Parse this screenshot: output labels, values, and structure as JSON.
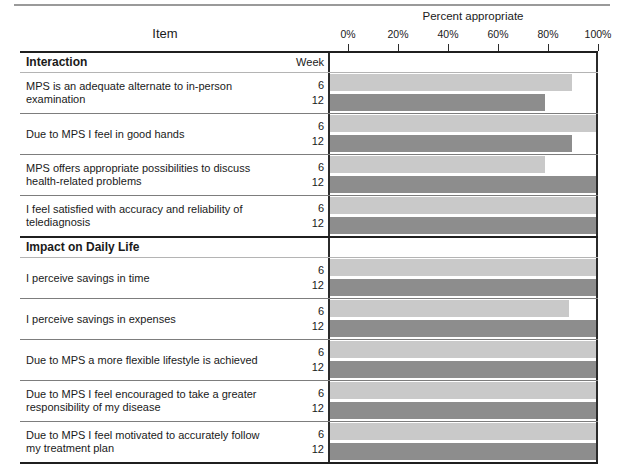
{
  "figure": {
    "chart_title": "Percent appropriate",
    "item_column_header": "Item",
    "week_column_header": "Week"
  },
  "axis": {
    "tick_labels": [
      "0%",
      "20%",
      "40%",
      "60%",
      "80%",
      "100%"
    ],
    "tick_values": [
      0,
      20,
      40,
      60,
      80,
      100
    ],
    "min": 0,
    "max": 100
  },
  "legend": {
    "week6_label": "6",
    "week12_label": "12",
    "week6_color": "#c9c9c9",
    "week12_color": "#8d8d8d"
  },
  "chart_data": {
    "type": "bar",
    "title": "Percent appropriate",
    "xlabel": "Percent appropriate",
    "ylabel": "Item",
    "xlim": [
      0,
      100
    ],
    "grid": false,
    "legend_position": "row-labels",
    "categories": [
      "MPS is an adequate alternate to in-person examination",
      "Due to MPS I feel in good hands",
      "MPS offers appropriate possibilities to discuss health-related problems",
      "I feel satisfied with accuracy and reliability of telediagnosis",
      "I perceive savings in time",
      "I perceive savings in expenses",
      "Due to MPS a more flexible lifestyle is achieved",
      "Due to MPS I feel encouraged to take a greater responsibility of my disease",
      "Due to MPS I feel motivated to accurately follow my treatment plan"
    ],
    "series": [
      {
        "name": "Week 6",
        "values": [
          91,
          100,
          81,
          100,
          100,
          90,
          100,
          100,
          100
        ]
      },
      {
        "name": "Week 12",
        "values": [
          81,
          91,
          100,
          100,
          100,
          100,
          100,
          100,
          100
        ]
      }
    ]
  },
  "sections": [
    {
      "heading": "Interaction",
      "week_header": "Week",
      "rows": [
        {
          "item": "MPS is an adequate alternate to in-person examination",
          "week6_label": "6",
          "week12_label": "12",
          "week6": 91,
          "week12": 81
        },
        {
          "item": "Due to MPS I feel in good hands",
          "week6_label": "6",
          "week12_label": "12",
          "week6": 100,
          "week12": 91
        },
        {
          "item": "MPS offers appropriate possibilities to discuss health-related problems",
          "week6_label": "6",
          "week12_label": "12",
          "week6": 81,
          "week12": 100
        },
        {
          "item": "I feel satisfied with accuracy and reliability of telediagnosis",
          "week6_label": "6",
          "week12_label": "12",
          "week6": 100,
          "week12": 100
        }
      ]
    },
    {
      "heading": "Impact on Daily Life",
      "week_header": "",
      "rows": [
        {
          "item": "I perceive savings in time",
          "week6_label": "6",
          "week12_label": "12",
          "week6": 100,
          "week12": 100
        },
        {
          "item": "I perceive savings in expenses",
          "week6_label": "6",
          "week12_label": "12",
          "week6": 90,
          "week12": 100
        },
        {
          "item": "Due to MPS a more flexible lifestyle is achieved",
          "week6_label": "6",
          "week12_label": "12",
          "week6": 100,
          "week12": 100
        },
        {
          "item": "Due to MPS I feel encouraged to take a greater responsibility of my disease",
          "week6_label": "6",
          "week12_label": "12",
          "week6": 100,
          "week12": 100
        },
        {
          "item": "Due to MPS I feel motivated to accurately follow my treatment plan",
          "week6_label": "6",
          "week12_label": "12",
          "week6": 100,
          "week12": 100
        }
      ]
    }
  ]
}
